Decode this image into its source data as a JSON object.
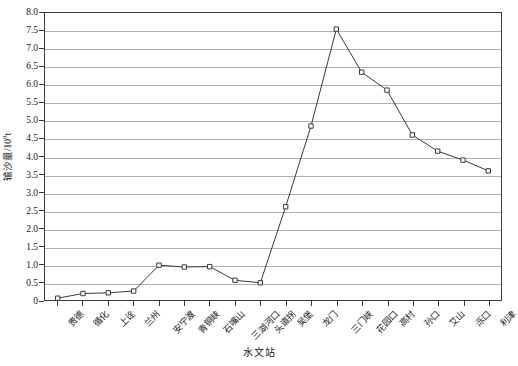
{
  "chart_data": {
    "type": "line",
    "title": "",
    "xlabel": "水文站",
    "ylabel": "输沙量/10⁸t",
    "ylabel_base": "输沙量/10",
    "ylabel_exp": "8",
    "ylabel_unit": "t",
    "grid": true,
    "legend": "none",
    "ylim": [
      0,
      8.0
    ],
    "yticks": [
      "0",
      "0.5",
      "1.0",
      "1.5",
      "2.0",
      "2.5",
      "3.0",
      "3.5",
      "4.0",
      "4.5",
      "5.0",
      "5.5",
      "6.0",
      "6.5",
      "7.0",
      "7.5",
      "8.0"
    ],
    "ytick_values": [
      0,
      0.5,
      1.0,
      1.5,
      2.0,
      2.5,
      3.0,
      3.5,
      4.0,
      4.5,
      5.0,
      5.5,
      6.0,
      6.5,
      7.0,
      7.5,
      8.0
    ],
    "categories": [
      "贵德",
      "循化",
      "上诠",
      "兰州",
      "安宁渡",
      "青铜峡",
      "石嘴山",
      "三湖河口",
      "头道拐",
      "吴堡",
      "龙门",
      "三门峡",
      "花园口",
      "高村",
      "孙口",
      "艾山",
      "泺口",
      "利津"
    ],
    "values": [
      0.05,
      0.18,
      0.2,
      0.25,
      0.97,
      0.92,
      0.93,
      0.55,
      0.48,
      2.6,
      4.85,
      7.55,
      6.35,
      5.85,
      4.6,
      4.15,
      3.9,
      3.6
    ],
    "marker": "open-square",
    "line_color": "#3a3a3a",
    "grid_color": "#b0b0b0",
    "frame_color": "#3a3a3a"
  },
  "axis": {
    "x_title": "水文站",
    "y_title_base": "输沙量/10",
    "y_title_exp": "8",
    "y_title_unit": "t"
  }
}
